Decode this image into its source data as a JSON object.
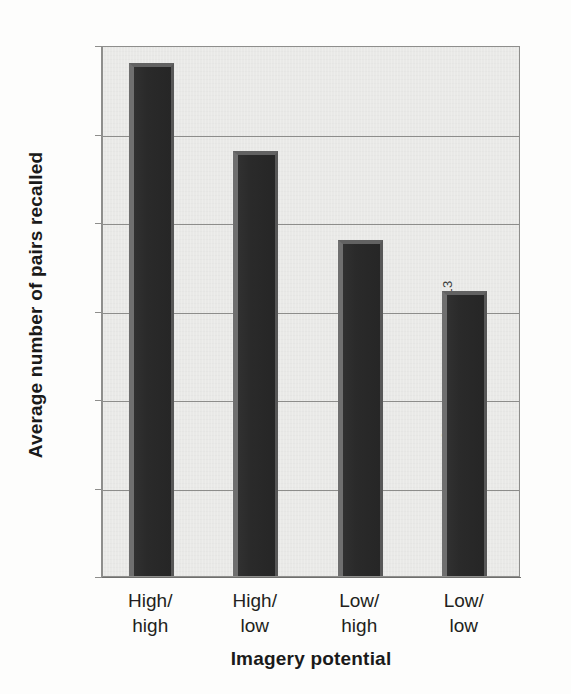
{
  "chart_data": {
    "type": "bar",
    "title": "",
    "subtitle": "",
    "categories": [
      "High/\nhigh",
      "High/\nlow",
      "Low/\nhigh",
      "Low/\nlow"
    ],
    "category_lines": [
      [
        "High/",
        "high"
      ],
      [
        "High/",
        "low"
      ],
      [
        "Low/",
        "high"
      ],
      [
        "Low/",
        "low"
      ]
    ],
    "values": [
      11.6,
      9.6,
      7.6,
      6.45
    ],
    "xlabel": "Imagery potential",
    "ylabel": "Average number of pairs recalled",
    "ylim": [
      0,
      12
    ],
    "ytick_values": [
      0,
      2,
      4,
      6,
      8,
      10,
      12
    ],
    "ytick_labels": [
      "0",
      "2",
      "4",
      "6",
      "8",
      "10",
      "12"
    ],
    "grid": true,
    "grid_axis": "y",
    "legend": false,
    "bar_color": "#2b2b2b",
    "bar_highlight_color": "#6f6f6f",
    "plot_background": "#e9e9e7",
    "gridline_color": "#8d8d8b"
  },
  "credit": {
    "text": "© Cengage Learning 2013"
  }
}
